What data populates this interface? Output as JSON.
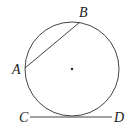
{
  "diagram": {
    "type": "circle-with-chord-and-tangent",
    "circle": {
      "cx": 72,
      "cy": 69,
      "r": 47,
      "stroke": "#444444"
    },
    "center_dot": {
      "cx": 72,
      "cy": 69
    },
    "chord": {
      "from": "A",
      "to": "B"
    },
    "tangent": {
      "from": "C",
      "to": "D"
    },
    "points": {
      "A": {
        "label": "A",
        "x": 24,
        "y": 68
      },
      "B": {
        "label": "B",
        "x": 80,
        "y": 21
      },
      "C": {
        "label": "C",
        "x": 30,
        "y": 117
      },
      "D": {
        "label": "D",
        "x": 112,
        "y": 117
      }
    }
  }
}
